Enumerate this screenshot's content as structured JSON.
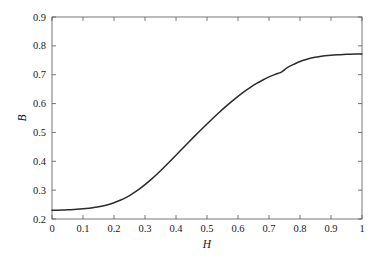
{
  "figure": {
    "background_color": "#ffffff",
    "plot_area": {
      "left": 52,
      "top": 17,
      "right": 362,
      "bottom": 219,
      "border_color": "#555555",
      "border_width": 0.8
    }
  },
  "chart_data": {
    "type": "line",
    "title": "",
    "subtitle": "",
    "xlabel": "H",
    "ylabel": "B",
    "xlim": [
      0,
      1
    ],
    "ylim": [
      0.2,
      0.9
    ],
    "grid": false,
    "legend": null,
    "legend_position": "none",
    "x_ticks": [
      0,
      0.1,
      0.2,
      0.3,
      0.4,
      0.5,
      0.6,
      0.7,
      0.8,
      0.9,
      1
    ],
    "x_tick_labels": [
      "0",
      "0.1",
      "0.2",
      "0.3",
      "0.4",
      "0.5",
      "0.6",
      "0.7",
      "0.8",
      "0.9",
      "1"
    ],
    "y_ticks": [
      0.2,
      0.3,
      0.4,
      0.5,
      0.6,
      0.7,
      0.8,
      0.9
    ],
    "y_tick_labels": [
      "0.2",
      "0.3",
      "0.4",
      "0.5",
      "0.6",
      "0.7",
      "0.8",
      "0.9"
    ],
    "tick_direction": "in",
    "series": [
      {
        "name": "B(H)",
        "color": "#2b2b2b",
        "line_width": 1.5,
        "x": [
          0.0,
          0.02,
          0.04,
          0.06,
          0.08,
          0.1,
          0.12,
          0.14,
          0.16,
          0.18,
          0.2,
          0.22,
          0.24,
          0.26,
          0.28,
          0.3,
          0.32,
          0.34,
          0.36,
          0.38,
          0.4,
          0.42,
          0.44,
          0.46,
          0.48,
          0.5,
          0.52,
          0.54,
          0.56,
          0.58,
          0.6,
          0.62,
          0.64,
          0.66,
          0.68,
          0.7,
          0.72,
          0.74,
          0.76,
          0.78,
          0.8,
          0.82,
          0.84,
          0.86,
          0.88,
          0.9,
          0.92,
          0.94,
          0.96,
          0.98,
          1.0
        ],
        "values": [
          0.23,
          0.2305,
          0.2312,
          0.2322,
          0.2335,
          0.2352,
          0.2375,
          0.2405,
          0.2445,
          0.2497,
          0.2563,
          0.2648,
          0.2752,
          0.2878,
          0.3025,
          0.319,
          0.3372,
          0.3568,
          0.3775,
          0.399,
          0.421,
          0.4432,
          0.4653,
          0.4871,
          0.5085,
          0.5295,
          0.55,
          0.57,
          0.5893,
          0.6078,
          0.6252,
          0.6414,
          0.6563,
          0.6698,
          0.6818,
          0.6923,
          0.7013,
          0.709,
          0.7255,
          0.736,
          0.746,
          0.753,
          0.7585,
          0.7625,
          0.7655,
          0.7678,
          0.7693,
          0.7703,
          0.771,
          0.7714,
          0.7716
        ]
      }
    ],
    "annotations": [],
    "notes": {
      "start_value": 0.23,
      "end_value": 0.772,
      "shape": "sigmoid / saturating magnetization-style curve",
      "inflection_x": 0.5,
      "saturation_begins_x": 0.78
    }
  }
}
